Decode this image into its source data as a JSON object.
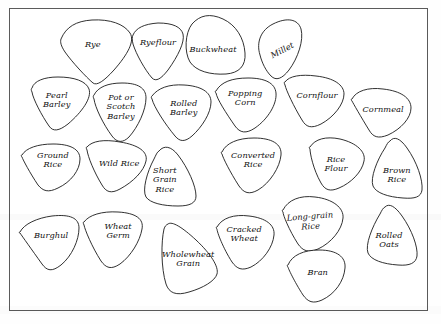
{
  "figure": {
    "kind": "labelled-shape-diagram",
    "background_color": "#fefefe",
    "frame_color": "#5a5a5a",
    "shape_fill": "#ffffff",
    "shape_stroke": "#1a1a1a",
    "label_color": "#111111"
  },
  "shapes": [
    {
      "id": "rye",
      "label": "Rye",
      "cx": 93,
      "cy": 45,
      "rotation": 0
    },
    {
      "id": "ryeflour",
      "label": "Ryeflour",
      "cx": 158,
      "cy": 43,
      "rotation": 0
    },
    {
      "id": "buckwheat",
      "label": "Buckwheat",
      "cx": 213,
      "cy": 50,
      "rotation": 0
    },
    {
      "id": "millet",
      "label": "Millet",
      "cx": 282,
      "cy": 51,
      "rotation": -28
    },
    {
      "id": "pearl-barley",
      "label": "Pearl\nBarley",
      "cx": 57,
      "cy": 100,
      "rotation": 0
    },
    {
      "id": "pot-scotch-barley",
      "label": "Pot or\nScotch\nBarley",
      "cx": 121,
      "cy": 107,
      "rotation": 0
    },
    {
      "id": "rolled-barley",
      "label": "Rolled\nBarley",
      "cx": 184,
      "cy": 108,
      "rotation": 0
    },
    {
      "id": "popping-corn",
      "label": "Popping\nCorn",
      "cx": 245,
      "cy": 98,
      "rotation": 0
    },
    {
      "id": "cornflour",
      "label": "Cornflour",
      "cx": 317,
      "cy": 96,
      "rotation": 0
    },
    {
      "id": "cornmeal",
      "label": "Cornmeal",
      "cx": 383,
      "cy": 110,
      "rotation": 0
    },
    {
      "id": "ground-rice",
      "label": "Ground\nRice",
      "cx": 53,
      "cy": 160,
      "rotation": 0
    },
    {
      "id": "wild-rice",
      "label": "Wild Rice",
      "cx": 119,
      "cy": 164,
      "rotation": 0
    },
    {
      "id": "short-grain-rice",
      "label": "Short\nGrain\nRice",
      "cx": 165,
      "cy": 180,
      "rotation": 0
    },
    {
      "id": "converted-rice",
      "label": "Converted\nRice",
      "cx": 253,
      "cy": 160,
      "rotation": 0
    },
    {
      "id": "rice-flour",
      "label": "Rice\nFlour",
      "cx": 336,
      "cy": 164,
      "rotation": 0
    },
    {
      "id": "brown-rice",
      "label": "Brown\nRice",
      "cx": 397,
      "cy": 175,
      "rotation": 0
    },
    {
      "id": "burghul",
      "label": "Burghul",
      "cx": 51,
      "cy": 236,
      "rotation": 0
    },
    {
      "id": "wheat-germ",
      "label": "Wheat\nGerm",
      "cx": 118,
      "cy": 231,
      "rotation": 0
    },
    {
      "id": "wholewheat-grain",
      "label": "Wholewheat\nGrain",
      "cx": 188,
      "cy": 259,
      "rotation": 0
    },
    {
      "id": "cracked-wheat",
      "label": "Cracked\nWheat",
      "cx": 244,
      "cy": 234,
      "rotation": 0
    },
    {
      "id": "long-grain-rice",
      "label": "Long-grain\nRice",
      "cx": 310,
      "cy": 221,
      "rotation": -4
    },
    {
      "id": "bran",
      "label": "Bran",
      "cx": 318,
      "cy": 273,
      "rotation": 0
    },
    {
      "id": "rolled-oats",
      "label": "Rolled\nOats",
      "cx": 389,
      "cy": 240,
      "rotation": 0
    }
  ]
}
